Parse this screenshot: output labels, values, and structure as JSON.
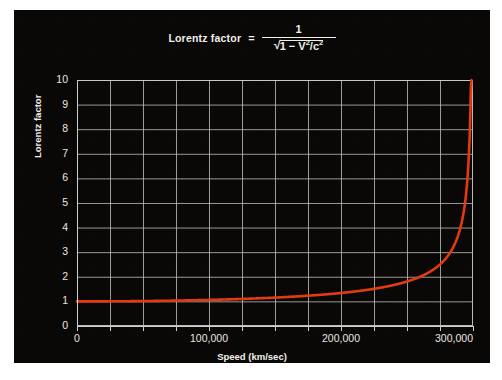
{
  "figure": {
    "background_color": "#0a0806",
    "text_color": "#f2efe9",
    "grid_color": "#bebebe",
    "curve_color": "#e23a12"
  },
  "title": {
    "lead": "Lorentz factor",
    "equals": "=",
    "numerator": "1",
    "denominator_radical": "√",
    "denominator_body": "1 − V",
    "denominator_sup1": "2",
    "denominator_slash": "/c",
    "denominator_sup2": "2"
  },
  "axes": {
    "x_title": "Speed (km/sec)",
    "y_title": "Lorentz factor",
    "x_ticklabels": [
      "0",
      "100,000",
      "200,000",
      "300,000"
    ],
    "y_ticklabels": [
      "0",
      "1",
      "2",
      "3",
      "4",
      "5",
      "6",
      "7",
      "8",
      "9",
      "10"
    ]
  },
  "chart_data": {
    "type": "line",
    "xlabel": "Speed (km/sec)",
    "ylabel": "Lorentz factor",
    "xlim": [
      0,
      300000
    ],
    "ylim": [
      0,
      10
    ],
    "xticks": [
      0,
      100000,
      200000,
      300000
    ],
    "yticks": [
      0,
      1,
      2,
      3,
      4,
      5,
      6,
      7,
      8,
      9,
      10
    ],
    "grid": true,
    "grid_x_step": 25000,
    "grid_y_step": 1,
    "legend": "none",
    "series": [
      {
        "name": "Lorentz factor",
        "color": "#e23a12",
        "linewidth": 2.6,
        "x": [
          0,
          25000,
          50000,
          75000,
          100000,
          125000,
          150000,
          175000,
          200000,
          225000,
          240000,
          250000,
          260000,
          270000,
          275000,
          280000,
          285000,
          288000,
          290000,
          292000,
          294000,
          295000,
          296000,
          297000,
          298000,
          298500,
          299000,
          299300,
          299500,
          299700
        ],
        "y": [
          1.0,
          1.003,
          1.014,
          1.032,
          1.057,
          1.091,
          1.136,
          1.194,
          1.269,
          1.373,
          1.46,
          1.532,
          1.623,
          1.742,
          1.819,
          1.913,
          2.031,
          2.12,
          2.193,
          2.28,
          2.388,
          2.455,
          2.534,
          2.63,
          2.758,
          2.846,
          2.96,
          3.06,
          3.15,
          3.27
        ]
      }
    ],
    "annotation": "γ → ∞ as V → c (curve rises asymptotically near 300,000 km/sec)"
  }
}
